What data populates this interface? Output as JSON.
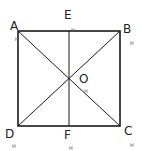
{
  "diagram": {
    "points": {
      "A": {
        "label": "A",
        "x": 18,
        "y": 31
      },
      "B": {
        "label": "B",
        "x": 120,
        "y": 31
      },
      "C": {
        "label": "C",
        "x": 120,
        "y": 126
      },
      "D": {
        "label": "D",
        "x": 18,
        "y": 126
      },
      "E": {
        "label": "E",
        "x": 69,
        "y": 31
      },
      "F": {
        "label": "F",
        "x": 69,
        "y": 126
      },
      "O": {
        "label": "O",
        "x": 69,
        "y": 79
      }
    },
    "segments": [
      "AB",
      "BC",
      "CD",
      "DA",
      "AC",
      "BD",
      "EF"
    ],
    "labels": {
      "A": "A",
      "B": "B",
      "C": "C",
      "D": "D",
      "E": "E",
      "F": "F",
      "O": "O"
    },
    "marks": [
      "H",
      "H",
      "H",
      "H",
      "H",
      "H",
      "H"
    ],
    "colors": {
      "line": "#1a1a1a",
      "text": "#222222"
    }
  }
}
